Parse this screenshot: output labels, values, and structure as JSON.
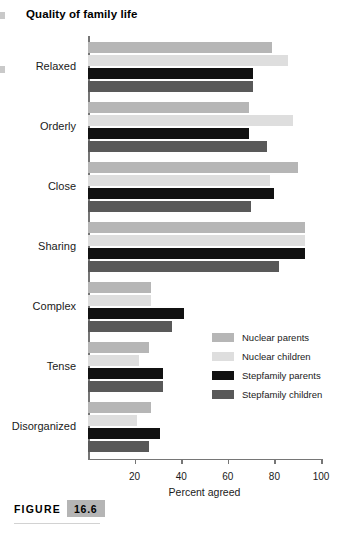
{
  "chart_title": "Quality of family life",
  "figure": {
    "word": "FIGURE",
    "number": "16.6"
  },
  "axis": {
    "xlabel": "Percent agreed",
    "ticks": [
      "20",
      "40",
      "60",
      "80",
      "100"
    ]
  },
  "legend": {
    "items": [
      {
        "label": "Nuclear parents",
        "color": "#b6b6b6"
      },
      {
        "label": "Nuclear children",
        "color": "#dedede"
      },
      {
        "label": "Stepfamily parents",
        "color": "#111111"
      },
      {
        "label": "Stepfamily children",
        "color": "#595959"
      }
    ]
  },
  "chart_data": {
    "type": "bar",
    "orientation": "horizontal",
    "title": "Quality of family life",
    "xlabel": "Percent agreed",
    "ylabel": "",
    "xlim": [
      0,
      100
    ],
    "xticks": [
      20,
      40,
      60,
      80,
      100
    ],
    "grid": false,
    "legend_position": "middle-right",
    "categories": [
      "Relaxed",
      "Orderly",
      "Close",
      "Sharing",
      "Complex",
      "Tense",
      "Disorganized"
    ],
    "series": [
      {
        "name": "Nuclear parents",
        "color": "#b6b6b6",
        "values": [
          79,
          69,
          90,
          93,
          27,
          26,
          27
        ]
      },
      {
        "name": "Nuclear children",
        "color": "#dedede",
        "values": [
          86,
          88,
          78,
          93,
          27,
          22,
          21
        ]
      },
      {
        "name": "Stepfamily parents",
        "color": "#111111",
        "values": [
          71,
          69,
          80,
          93,
          41,
          32,
          31
        ]
      },
      {
        "name": "Stepfamily children",
        "color": "#595959",
        "values": [
          71,
          77,
          70,
          82,
          36,
          32,
          26
        ]
      }
    ]
  }
}
